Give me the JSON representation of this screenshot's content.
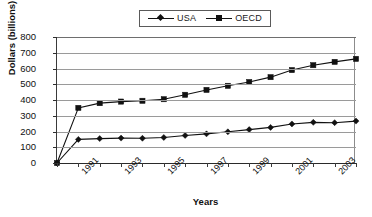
{
  "chart_data": {
    "type": "line",
    "title": "",
    "xlabel": "Years",
    "ylabel": "Dollars (billions)",
    "ylim": [
      0,
      800
    ],
    "ytick_labels": [
      "800",
      "700",
      "600",
      "500",
      "400",
      "300",
      "200",
      "100",
      "0"
    ],
    "ytick_values": [
      800,
      700,
      600,
      500,
      400,
      300,
      200,
      100,
      0
    ],
    "grid": true,
    "legend_position": "top-center",
    "x": [
      1990,
      1991,
      1992,
      1993,
      1994,
      1995,
      1996,
      1997,
      1998,
      1999,
      2000,
      2001,
      2002,
      2003,
      2004
    ],
    "categories": [
      "1990",
      "1991",
      "1992",
      "1993",
      "1994",
      "1995",
      "1996",
      "1997",
      "1998",
      "1999",
      "2000",
      "2001",
      "2002",
      "2003",
      "2004"
    ],
    "xtick_labels_shown": [
      "1991",
      "1993",
      "1995",
      "1997",
      "1999",
      "2001",
      "2003"
    ],
    "xlim": [
      1990,
      2004
    ],
    "series": [
      {
        "name": "USA",
        "marker": "diamond",
        "color": "#111111",
        "values": [
          0,
          150,
          155,
          158,
          157,
          162,
          175,
          185,
          198,
          212,
          226,
          248,
          258,
          256,
          266
        ]
      },
      {
        "name": "OECD",
        "marker": "square",
        "color": "#111111",
        "values": [
          0,
          350,
          380,
          390,
          395,
          405,
          433,
          464,
          490,
          514,
          545,
          590,
          621,
          642,
          661
        ]
      }
    ]
  },
  "legend": {
    "entries": [
      {
        "label": "USA",
        "marker": "diamond"
      },
      {
        "label": "OECD",
        "marker": "square"
      }
    ]
  },
  "axes": {
    "y_title": "Dollars (billions)",
    "x_title": "Years"
  }
}
